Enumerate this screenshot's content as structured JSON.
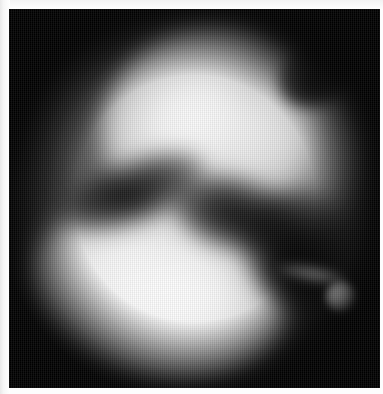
{
  "page": {
    "width": 383,
    "height": 394,
    "background_color": "#ffffff",
    "caption": ""
  },
  "plate": {
    "label": "grayscale scan plate",
    "background_color": "#050505",
    "x": 9,
    "y": 9,
    "width": 371,
    "height": 379
  },
  "image_data": {
    "type": "grayscale-scan",
    "modality": "nuclear-medicine-scintigram",
    "colormap": "grayscale",
    "min_level": 0,
    "max_level": 255,
    "description": "Two large bright lobes separated by a dark curved band, with a small intense focal hotspot at the right margin, on a black background.",
    "features": [
      {
        "name": "upper-lobe",
        "kind": "bright-region",
        "center_x": 196,
        "center_y": 108,
        "radius_x": 109,
        "radius_y": 98,
        "peak_intensity": 252,
        "rotation_deg": -14
      },
      {
        "name": "upper-lobe-right-shoulder",
        "kind": "bright-region",
        "center_x": 296,
        "center_y": 155,
        "radius_x": 69,
        "radius_y": 84,
        "peak_intensity": 198,
        "rotation_deg": 12
      },
      {
        "name": "lower-lobe",
        "kind": "bright-region",
        "center_x": 158,
        "center_y": 294,
        "radius_x": 131,
        "radius_y": 89,
        "peak_intensity": 254,
        "rotation_deg": 6
      },
      {
        "name": "lower-lobe-left-bulge",
        "kind": "bright-region",
        "center_x": 89,
        "center_y": 271,
        "radius_x": 70,
        "radius_y": 66,
        "peak_intensity": 206,
        "rotation_deg": -18
      },
      {
        "name": "dark-separating-band",
        "kind": "dark-region",
        "path_description": "S-shaped trough running from mid-left downward to the right",
        "min_intensity": 38
      },
      {
        "name": "top-right-notch",
        "kind": "dark-region",
        "center_x": 316,
        "center_y": 74,
        "min_intensity": 12
      },
      {
        "name": "focal-hotspot",
        "kind": "bright-point",
        "center_x": 341,
        "center_y": 297,
        "radius": 10,
        "peak_intensity": 255
      }
    ],
    "texture": {
      "name": "raster-scanlines",
      "orientation": "vertical",
      "period_px": 2
    }
  },
  "colors": {
    "paper": "#ffffff",
    "plate_black": "#050505",
    "highlight_white": "#ffffff",
    "midtone_gray": "#8c8c8c",
    "shadow_gray": "#262626"
  }
}
